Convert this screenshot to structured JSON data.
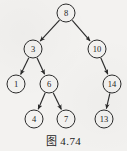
{
  "figure": {
    "caption": "图 4.74",
    "background_color": "#f3f2f0",
    "ink_color": "#2b2b2b"
  },
  "chart_data": {
    "type": "diagram",
    "diagram_kind": "binary-search-tree",
    "title": "图 4.74",
    "directed": true,
    "node_radius": 9,
    "nodes": [
      {
        "id": "n8",
        "label": "8",
        "x": 66,
        "y": 13
      },
      {
        "id": "n3",
        "label": "3",
        "x": 33,
        "y": 49
      },
      {
        "id": "n10",
        "label": "10",
        "x": 97,
        "y": 49
      },
      {
        "id": "n1",
        "label": "1",
        "x": 16,
        "y": 84
      },
      {
        "id": "n6",
        "label": "6",
        "x": 49,
        "y": 84
      },
      {
        "id": "n14",
        "label": "14",
        "x": 112,
        "y": 84
      },
      {
        "id": "n4",
        "label": "4",
        "x": 34,
        "y": 119
      },
      {
        "id": "n7",
        "label": "7",
        "x": 66,
        "y": 119
      },
      {
        "id": "n13",
        "label": "13",
        "x": 104,
        "y": 119
      }
    ],
    "edges": [
      {
        "from": "n8",
        "to": "n3"
      },
      {
        "from": "n8",
        "to": "n10"
      },
      {
        "from": "n3",
        "to": "n1"
      },
      {
        "from": "n3",
        "to": "n6"
      },
      {
        "from": "n10",
        "to": "n14"
      },
      {
        "from": "n6",
        "to": "n4"
      },
      {
        "from": "n6",
        "to": "n7"
      },
      {
        "from": "n14",
        "to": "n13"
      }
    ]
  }
}
